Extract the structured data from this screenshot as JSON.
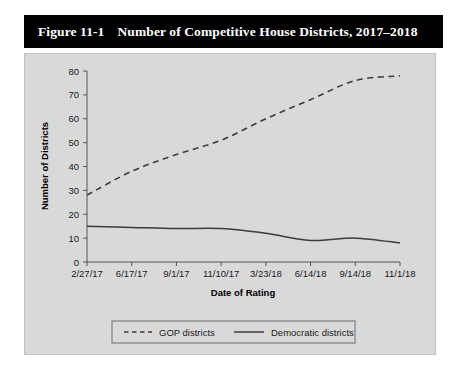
{
  "figure": {
    "number": "Figure 11-1",
    "title": "Number of Competitive House Districts, 2017–2018"
  },
  "chart_data": {
    "type": "line",
    "title": "Number of Competitive House Districts, 2017–2018",
    "xlabel": "Date of Rating",
    "ylabel": "Number of Districts",
    "ylim": [
      0,
      80
    ],
    "yticks": [
      0,
      10,
      20,
      30,
      40,
      50,
      60,
      70,
      80
    ],
    "grid": false,
    "legend_position": "bottom",
    "categories": [
      "2/27/17",
      "6/17/17",
      "9/1/17",
      "11/10/17",
      "3/23/18",
      "6/14/18",
      "9/14/18",
      "11/1/18"
    ],
    "series": [
      {
        "name": "GOP districts",
        "style": "dashed",
        "color": "#3b3b3b",
        "values": [
          28,
          38,
          45,
          51,
          60,
          68,
          76,
          78
        ]
      },
      {
        "name": "Democratic districts",
        "style": "solid",
        "color": "#3b3b3b",
        "values": [
          15,
          14.5,
          14,
          14,
          12,
          9,
          10,
          8
        ]
      }
    ]
  },
  "legend": {
    "gop_label": "GOP districts",
    "dem_label": "Democratic districts"
  }
}
